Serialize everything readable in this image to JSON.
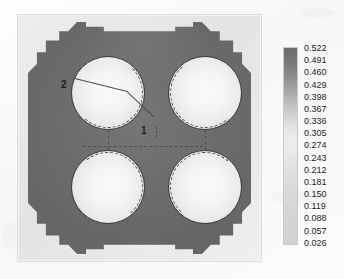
{
  "figure": {
    "type": "contour-field-plot"
  },
  "chart_data": {
    "type": "heatmap",
    "title": "",
    "xlabel": "",
    "ylabel": "",
    "grid": false,
    "legend_position": "right",
    "colormap": "grayscale",
    "colorbar": {
      "orientation": "vertical",
      "min": 0.026,
      "max": 0.522,
      "step": 0.031,
      "labels": [
        "0.522",
        "0.491",
        "0.460",
        "0.429",
        "0.398",
        "0.367",
        "0.336",
        "0.305",
        "0.274",
        "0.243",
        "0.212",
        "0.181",
        "0.150",
        "0.119",
        "0.088",
        "0.057",
        "0.026"
      ],
      "swatch_colors": [
        "#6b6b6b",
        "#777777",
        "#8b8b8b",
        "#a3a3a3",
        "#bdbdbd",
        "#d4d4d4",
        "#e4e4e4",
        "#ededed",
        "#e9e9e9",
        "#e2e2e2",
        "#dcdcdc",
        "#d8d8d8",
        "#d5d5d5",
        "#d3d3d3",
        "#d2d2d2",
        "#d2d2d2",
        "#d2d2d2"
      ]
    },
    "regions": [
      {
        "name": "matrix",
        "value_range": [
          0.43,
          0.522
        ],
        "fill": "#6e6e6e"
      },
      {
        "name": "outer-boundary",
        "value_range": [
          0.15,
          0.3
        ],
        "fill": "#e8e8e8"
      },
      {
        "name": "inclusion",
        "value_range": [
          0.026,
          0.12
        ],
        "fill": "#f6f6f6"
      }
    ],
    "inclusions": [
      {
        "id": "top-left",
        "cx": 91,
        "cy": 79,
        "r": 37
      },
      {
        "id": "top-right",
        "cx": 188,
        "cy": 79,
        "r": 37
      },
      {
        "id": "bottom-left",
        "cx": 91,
        "cy": 173,
        "r": 37
      },
      {
        "id": "bottom-right",
        "cx": 188,
        "cy": 173,
        "r": 37
      }
    ]
  },
  "annotations": [
    {
      "id": "label-1",
      "text": "1",
      "description": "neck region between upper inclusions"
    },
    {
      "id": "label-2",
      "text": "2",
      "description": "crack origin at upper-left inclusion edge"
    }
  ]
}
